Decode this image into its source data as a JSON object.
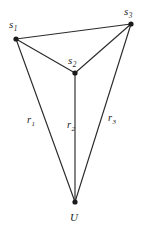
{
  "figure": {
    "title": "",
    "background_color": "#ffffff",
    "line_color": "#2b2b2b",
    "vertex_color": "#1a1a1a",
    "width": 147,
    "height": 228
  },
  "nodes": [
    {
      "id": "s1",
      "base": "s",
      "sub": "1",
      "x": 16,
      "y": 39,
      "label_x": 9,
      "label_y": 28,
      "sub_dx": 0.5,
      "sub_dy": 2.6
    },
    {
      "id": "s2",
      "base": "s",
      "sub": "2",
      "x": 75,
      "y": 73,
      "label_x": 68,
      "label_y": 64,
      "sub_dx": 0.5,
      "sub_dy": 2.6
    },
    {
      "id": "s3",
      "base": "s",
      "sub": "3",
      "x": 131,
      "y": 24,
      "label_x": 124,
      "label_y": 15,
      "sub_dx": 0.5,
      "sub_dy": 2.6
    },
    {
      "id": "U",
      "base": "U",
      "sub": "",
      "x": 75,
      "y": 202,
      "label_x": 70,
      "label_y": 221,
      "sub_dx": 0,
      "sub_dy": 0
    }
  ],
  "edges": [
    {
      "id": "edge-s1-s3",
      "from": "s1",
      "to": "s3",
      "x1": 16,
      "y1": 39,
      "x2": 131,
      "y2": 24
    },
    {
      "id": "edge-s1-s2",
      "from": "s1",
      "to": "s2",
      "x1": 16,
      "y1": 39,
      "x2": 75,
      "y2": 73
    },
    {
      "id": "edge-s2-s3",
      "from": "s2",
      "to": "s3",
      "x1": 75,
      "y1": 73,
      "x2": 131,
      "y2": 24
    }
  ],
  "radials": [
    {
      "id": "radial-r1",
      "base": "r",
      "sub": "1",
      "from": "s1",
      "to": "U",
      "x1": 16,
      "y1": 39,
      "x2": 75,
      "y2": 202,
      "label_x": 27,
      "label_y": 123,
      "sub_dx": 0.5,
      "sub_dy": 2.5
    },
    {
      "id": "radial-r2",
      "base": "r",
      "sub": "2",
      "from": "s2",
      "to": "U",
      "x1": 75,
      "y1": 73,
      "x2": 75,
      "y2": 202,
      "label_x": 67,
      "label_y": 128,
      "sub_dx": 0.5,
      "sub_dy": 2.5
    },
    {
      "id": "radial-r3",
      "base": "r",
      "sub": "3",
      "from": "s3",
      "to": "U",
      "x1": 131,
      "y1": 24,
      "x2": 75,
      "y2": 202,
      "label_x": 108,
      "label_y": 121,
      "sub_dx": 0.5,
      "sub_dy": 2.5
    }
  ],
  "labels": {
    "s1": "s",
    "s1_sub": "1",
    "s2": "s",
    "s2_sub": "2",
    "s3": "s",
    "s3_sub": "3",
    "u": "U",
    "r1": "r",
    "r1_sub": "1",
    "r2": "r",
    "r2_sub": "2",
    "r3": "r",
    "r3_sub": "3"
  }
}
